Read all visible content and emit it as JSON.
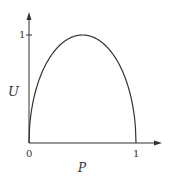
{
  "chart_data": {
    "type": "line",
    "title": "",
    "xlabel": "P",
    "ylabel": "U",
    "xlim": [
      0,
      1
    ],
    "ylim": [
      0,
      1
    ],
    "x_ticks": [
      "0",
      "1"
    ],
    "y_ticks": [
      "1"
    ],
    "grid": false,
    "legend": null,
    "series": [
      {
        "name": "U(P)",
        "x": [
          0,
          0.05,
          0.1,
          0.2,
          0.3,
          0.4,
          0.5,
          0.6,
          0.7,
          0.8,
          0.9,
          0.95,
          1
        ],
        "y": [
          0,
          0.44,
          0.6,
          0.8,
          0.92,
          0.98,
          1,
          0.98,
          0.92,
          0.8,
          0.6,
          0.44,
          0
        ]
      }
    ]
  },
  "labels": {
    "y_axis": "U",
    "x_axis": "P",
    "x_tick_0": "0",
    "x_tick_1": "1",
    "y_tick_1": "1"
  }
}
